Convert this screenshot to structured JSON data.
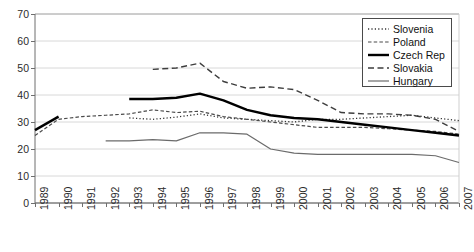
{
  "chart_data": {
    "type": "line",
    "title": "",
    "xlabel": "",
    "ylabel": "",
    "ylim": [
      0,
      70
    ],
    "ytick_step": 10,
    "yticks": [
      0,
      10,
      20,
      30,
      40,
      50,
      60,
      70
    ],
    "grid": true,
    "grid_axis": "y",
    "legend_position": "top-right",
    "categories": [
      "1989",
      "1990",
      "1991",
      "1992",
      "1993",
      "1994",
      "1995",
      "1996",
      "1997",
      "1998",
      "1999",
      "2000",
      "2001",
      "2002",
      "2003",
      "2004",
      "2005",
      "2006",
      "2007"
    ],
    "series": [
      {
        "name": "Slovenia",
        "style": "dotted",
        "color": "#333333",
        "width": 1.3,
        "values": [
          null,
          null,
          null,
          null,
          31.5,
          31.0,
          31.8,
          33.0,
          31.5,
          31.0,
          30.5,
          30.0,
          31.0,
          31.0,
          31.5,
          32.0,
          32.5,
          31.5,
          30.5
        ]
      },
      {
        "name": "Poland",
        "style": "fine-dash",
        "color": "#4a4a4a",
        "width": 1.2,
        "values": [
          25.0,
          31.0,
          32.0,
          32.5,
          33.0,
          34.5,
          33.5,
          34.0,
          32.0,
          31.0,
          30.0,
          29.0,
          28.0,
          28.0,
          28.0,
          27.5,
          27.0,
          26.5,
          25.5
        ]
      },
      {
        "name": "Czech Rep",
        "style": "solid-thick",
        "color": "#000000",
        "width": 2.4,
        "values": [
          27.0,
          32.0,
          null,
          null,
          38.5,
          38.5,
          39.0,
          40.5,
          38.0,
          34.5,
          32.5,
          31.5,
          31.0,
          30.0,
          29.0,
          28.0,
          27.0,
          26.0,
          25.0
        ]
      },
      {
        "name": "Slovakia",
        "style": "dash",
        "color": "#3d3d3d",
        "width": 1.4,
        "values": [
          null,
          null,
          null,
          null,
          null,
          49.5,
          50.0,
          51.8,
          45.0,
          42.5,
          43.0,
          42.0,
          38.0,
          33.5,
          33.0,
          33.0,
          32.5,
          31.0,
          26.5
        ]
      },
      {
        "name": "Hungary",
        "style": "solid-thin",
        "color": "#6b6b6b",
        "width": 1.2,
        "values": [
          null,
          null,
          null,
          23.0,
          23.0,
          23.5,
          23.0,
          26.0,
          26.0,
          25.5,
          20.0,
          18.5,
          18.0,
          18.0,
          18.0,
          18.0,
          18.0,
          17.5,
          15.0
        ]
      }
    ]
  },
  "legend": {
    "entries": [
      {
        "label": "Slovenia"
      },
      {
        "label": "Poland"
      },
      {
        "label": "Czech Rep"
      },
      {
        "label": "Slovakia"
      },
      {
        "label": "Hungary"
      }
    ]
  }
}
